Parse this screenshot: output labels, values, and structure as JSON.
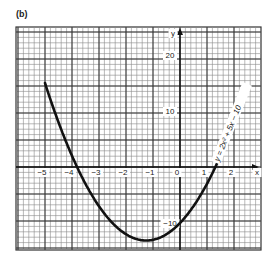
{
  "panel_label": "(b)",
  "chart_data": {
    "type": "line",
    "title": "",
    "equation_label": "y = 2x² + 5x − 10",
    "xlabel": "x",
    "ylabel": "y",
    "xlim": [
      -5.5,
      3.5
    ],
    "ylim": [
      -15,
      25
    ],
    "x_ticks": [
      -5,
      -4,
      -3,
      -2,
      -1,
      0,
      1,
      2
    ],
    "x_tick_labels": [
      "−5",
      "−4",
      "−3",
      "−2",
      "−1",
      "0",
      "1",
      "2"
    ],
    "y_ticks": [
      -10,
      10,
      20
    ],
    "y_tick_labels": [
      "−10",
      "10",
      "20"
    ],
    "grid": true,
    "legend": "none",
    "series": [
      {
        "name": "y = 2x² + 5x − 10",
        "x": [
          -5,
          -4.5,
          -4,
          -3.5,
          -3,
          -2.5,
          -2,
          -1.5,
          -1.25,
          -1,
          -0.5,
          0,
          0.5,
          1,
          1.5,
          2
        ],
        "y": [
          15,
          7.5,
          2,
          -1.5,
          -7,
          -10,
          -12,
          -13,
          -13.125,
          -13,
          -12,
          -10,
          -7,
          -3,
          2,
          8
        ]
      }
    ]
  }
}
